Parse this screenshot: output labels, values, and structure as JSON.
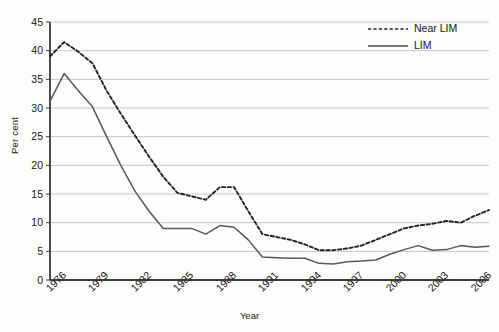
{
  "chart_data": {
    "type": "line",
    "title": "",
    "xlabel": "Year",
    "ylabel": "Per cent",
    "ylim": [
      0,
      45
    ],
    "ytick_step": 5,
    "yticks": [
      0,
      5,
      10,
      15,
      20,
      25,
      30,
      35,
      40,
      45
    ],
    "xlim": [
      1976,
      2007
    ],
    "xtick_labels": [
      "1976",
      "1979",
      "1982",
      "1985",
      "1988",
      "1991",
      "1994",
      "1997",
      "2000",
      "2003",
      "2006"
    ],
    "xtick_values": [
      1976,
      1979,
      1982,
      1985,
      1988,
      1991,
      1994,
      1997,
      2000,
      2003,
      2006
    ],
    "grid": "horizontal",
    "legend_position": "top-right",
    "x": [
      1976,
      1977,
      1978,
      1979,
      1980,
      1981,
      1982,
      1983,
      1984,
      1985,
      1986,
      1987,
      1988,
      1989,
      1990,
      1991,
      1992,
      1993,
      1994,
      1995,
      1996,
      1997,
      1998,
      1999,
      2000,
      2001,
      2002,
      2003,
      2004,
      2005,
      2006,
      2007
    ],
    "series": [
      {
        "name": "Near LIM",
        "style": "dashed",
        "color": "#222222",
        "values": [
          39.0,
          41.5,
          39.8,
          37.8,
          33.0,
          29.0,
          25.2,
          21.5,
          18.0,
          15.2,
          14.6,
          14.0,
          16.2,
          16.2,
          12.0,
          8.0,
          7.5,
          7.0,
          6.2,
          5.2,
          5.2,
          5.5,
          6.0,
          7.0,
          8.0,
          9.0,
          9.5,
          9.8,
          10.3,
          10.0,
          11.2,
          12.2
        ]
      },
      {
        "name": "LIM",
        "style": "solid",
        "color": "#575757",
        "values": [
          31.2,
          36.0,
          33.0,
          30.2,
          25.0,
          20.0,
          15.5,
          12.0,
          9.0,
          9.0,
          9.0,
          8.0,
          9.5,
          9.2,
          7.0,
          4.0,
          3.9,
          3.8,
          3.8,
          2.9,
          2.8,
          3.2,
          3.3,
          3.5,
          4.5,
          5.3,
          6.0,
          5.2,
          5.3,
          6.0,
          5.7,
          5.9
        ]
      }
    ]
  },
  "legend": {
    "entries": [
      {
        "label": "Near LIM"
      },
      {
        "label": "LIM"
      }
    ]
  }
}
